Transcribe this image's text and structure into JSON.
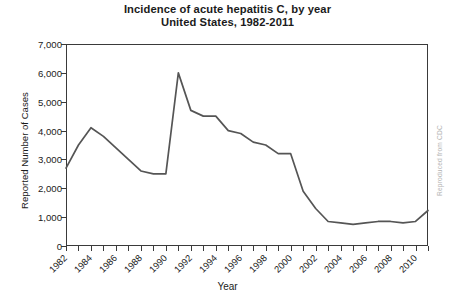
{
  "chart_data": {
    "type": "line",
    "title": "Incidence of acute hepatitis C, by year",
    "subtitle": "United States, 1982-2011",
    "title_lines": [
      "Incidence of acute hepatitis C, by year",
      "United States, 1982-2011"
    ],
    "xlabel": "Year",
    "ylabel": "Reported Number of Cases",
    "grid": false,
    "legend": "none",
    "xlim": [
      1982,
      2011
    ],
    "ylim": [
      0,
      7000
    ],
    "y_ticks": [
      0,
      1000,
      2000,
      3000,
      4000,
      5000,
      6000,
      7000
    ],
    "y_tick_labels": [
      "0",
      "1,000",
      "2,000",
      "3,000",
      "4,000",
      "5,000",
      "6,000",
      "7,000"
    ],
    "x_ticks": [
      1982,
      1983,
      1984,
      1985,
      1986,
      1987,
      1988,
      1989,
      1990,
      1991,
      1992,
      1993,
      1994,
      1995,
      1996,
      1997,
      1998,
      1999,
      2000,
      2001,
      2002,
      2003,
      2004,
      2005,
      2006,
      2007,
      2008,
      2009,
      2010,
      2011
    ],
    "x_tick_labels": [
      "1982",
      "1984",
      "1986",
      "1988",
      "1990",
      "1992",
      "1994",
      "1996",
      "1998",
      "2000",
      "2002",
      "2004",
      "2006",
      "2008",
      "2010"
    ],
    "x_labeled_years": [
      1982,
      1984,
      1986,
      1988,
      1990,
      1992,
      1994,
      1996,
      1998,
      2000,
      2002,
      2004,
      2006,
      2008,
      2010
    ],
    "line_color": "#555555",
    "x": [
      1982,
      1983,
      1984,
      1985,
      1986,
      1987,
      1988,
      1989,
      1990,
      1991,
      1992,
      1993,
      1994,
      1995,
      1996,
      1997,
      1998,
      1999,
      2000,
      2001,
      2002,
      2003,
      2004,
      2005,
      2006,
      2007,
      2008,
      2009,
      2010,
      2011
    ],
    "values": [
      2700,
      3500,
      4100,
      3800,
      3400,
      3000,
      2600,
      2500,
      2500,
      6000,
      4700,
      4500,
      4500,
      4000,
      3900,
      3600,
      3500,
      3200,
      3200,
      1900,
      1300,
      850,
      800,
      750,
      800,
      850,
      850,
      800,
      850,
      1230
    ],
    "series": [
      {
        "name": "Reported cases of acute hepatitis C",
        "values": [
          2700,
          3500,
          4100,
          3800,
          3400,
          3000,
          2600,
          2500,
          2500,
          6000,
          4700,
          4500,
          4500,
          4000,
          3900,
          3600,
          3500,
          3200,
          3200,
          1900,
          1300,
          850,
          800,
          750,
          800,
          850,
          850,
          800,
          850,
          1230
        ]
      }
    ],
    "annotations": []
  },
  "credit": "Reproduced from CDC"
}
